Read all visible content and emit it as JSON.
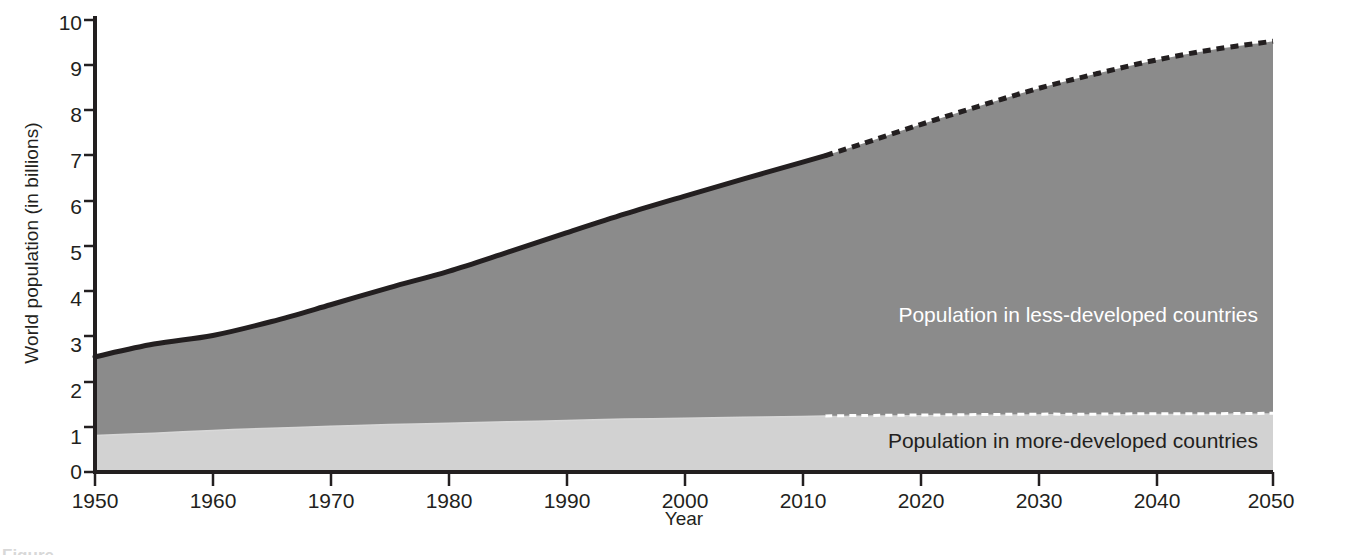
{
  "chart_data": {
    "type": "area",
    "title": "",
    "subtitle": "",
    "xlabel": "Year",
    "ylabel": "World population (in billions)",
    "xlim": [
      1950,
      2050
    ],
    "ylim": [
      0,
      10
    ],
    "grid": false,
    "legend_position": "inline-annotations",
    "stacked": true,
    "x": [
      1950,
      1955,
      1960,
      1965,
      1970,
      1975,
      1980,
      1985,
      1990,
      1995,
      2000,
      2005,
      2010,
      2012,
      2015,
      2020,
      2025,
      2030,
      2035,
      2040,
      2045,
      2050
    ],
    "xticks": [
      1950,
      1960,
      1970,
      1980,
      1990,
      2000,
      2010,
      2020,
      2030,
      2040,
      2050
    ],
    "yticks": [
      0,
      1,
      2,
      3,
      4,
      5,
      6,
      7,
      8,
      9,
      10
    ],
    "projection_starts_at": 2012,
    "series": [
      {
        "name": "Population in more-developed countries",
        "color": "#d2d2d2",
        "values": [
          0.81,
          0.86,
          0.92,
          0.97,
          1.01,
          1.05,
          1.08,
          1.11,
          1.14,
          1.17,
          1.19,
          1.21,
          1.23,
          1.24,
          1.25,
          1.26,
          1.27,
          1.28,
          1.28,
          1.29,
          1.29,
          1.3
        ]
      },
      {
        "name": "Population in less-developed countries",
        "color": "#8b8b8b",
        "values": [
          1.74,
          1.97,
          2.1,
          2.36,
          2.69,
          3.03,
          3.36,
          3.75,
          4.15,
          4.54,
          4.91,
          5.27,
          5.62,
          5.76,
          6.0,
          6.42,
          6.82,
          7.2,
          7.53,
          7.82,
          8.06,
          8.23
        ]
      }
    ],
    "totals": [
      2.55,
      2.83,
      3.02,
      3.33,
      3.7,
      4.08,
      4.44,
      4.86,
      5.29,
      5.71,
      6.1,
      6.48,
      6.85,
      7.0,
      7.25,
      7.68,
      8.09,
      8.48,
      8.81,
      9.11,
      9.35,
      9.53
    ],
    "annotations": [
      {
        "text": "Population in less-developed countries",
        "x": 2035,
        "y": 4.5,
        "color": "#ffffff"
      },
      {
        "text": "Population in more-developed countries",
        "x": 2035,
        "y": 0.55,
        "color": "#231f20"
      }
    ]
  },
  "axes": {
    "y_title": "World population (in billions)",
    "x_title": "Year",
    "y_tick_labels": [
      "10",
      "9",
      "8",
      "7",
      "6",
      "5",
      "4",
      "3",
      "2",
      "1",
      "0"
    ],
    "x_tick_labels": [
      "1950",
      "1960",
      "1970",
      "1980",
      "1990",
      "2000",
      "2010",
      "2020",
      "2030",
      "2040",
      "2050"
    ]
  },
  "labels": {
    "less_developed": "Population in less-developed countries",
    "more_developed": "Population in more-developed countries"
  },
  "source_note": "(Compiled by the authors using data from United Nations Population Division and Population Reference Bureau.)",
  "bottom_caption": "Figure",
  "colors": {
    "more_developed_fill": "#d2d2d2",
    "less_developed_fill": "#8b8b8b",
    "axis": "#231f20",
    "curve": "#231f20",
    "text": "#231f20",
    "label_on_dark": "#ffffff",
    "background": "#ffffff"
  }
}
